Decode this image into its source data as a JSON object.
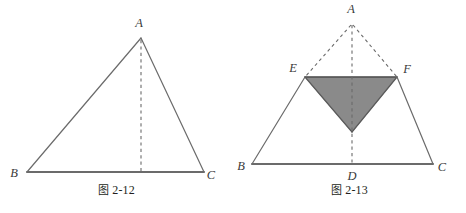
{
  "page": {
    "background_color": "#ffffff",
    "width": 466,
    "height": 213,
    "kind": "geometry-figure-pair"
  },
  "style": {
    "solid_stroke_color": "#6b6b6b",
    "dashed_stroke_color": "#6b6b6b",
    "baseline_stroke_color": "#6b6b6b",
    "shade_fill_color": "#8a8a8a",
    "shade_edge_color": "#4d4d4d",
    "label_color": "#3a3a3a",
    "solid_stroke_width": 1.2,
    "dashed_stroke_width": 1.1,
    "baseline_stroke_width": 2.0
  },
  "figure_1": {
    "caption_cjk": "图",
    "caption_number": "2-12",
    "caption_full": "图 2-12",
    "vertices": [
      {
        "name": "A",
        "label": "A",
        "x": 141,
        "y": 38,
        "label_x": 139,
        "label_y": 27
      },
      {
        "name": "B",
        "label": "B",
        "x": 27,
        "y": 172,
        "label_x": 14,
        "label_y": 177
      },
      {
        "name": "C",
        "label": "C",
        "x": 204,
        "y": 172,
        "label_x": 208,
        "label_y": 179
      },
      {
        "name": "D-foot",
        "label": "",
        "x": 141,
        "y": 172,
        "label_x": 141,
        "label_y": 172
      }
    ],
    "solid_edges": [
      {
        "name": "edge-AB",
        "from": "A",
        "to": "B"
      },
      {
        "name": "edge-AC",
        "from": "A",
        "to": "C"
      }
    ],
    "baseline_edges": [
      {
        "name": "edge-BC",
        "from": "B",
        "to": "C"
      }
    ],
    "dashed_edges": [
      {
        "name": "altitude-A-to-BC",
        "from": "A",
        "to": "D-foot"
      }
    ],
    "shaded_regions": []
  },
  "figure_2": {
    "caption_cjk": "图",
    "caption_number": "2-13",
    "caption_full": "图 2-13",
    "vertices": [
      {
        "name": "A",
        "label": "A",
        "x": 119,
        "y": 22,
        "label_x": 117,
        "label_y": 12
      },
      {
        "name": "B",
        "label": "B",
        "x": 19,
        "y": 164,
        "label_x": 7,
        "label_y": 170
      },
      {
        "name": "C",
        "label": "C",
        "x": 200,
        "y": 164,
        "label_x": 205,
        "label_y": 171
      },
      {
        "name": "D",
        "label": "D",
        "x": 119,
        "y": 164,
        "label_x": 116,
        "label_y": 180
      },
      {
        "name": "E",
        "label": "E",
        "x": 72,
        "y": 77,
        "label_x": 59,
        "label_y": 72
      },
      {
        "name": "F",
        "label": "F",
        "x": 164,
        "y": 77,
        "label_x": 169,
        "label_y": 73
      },
      {
        "name": "G-apex",
        "label": "",
        "x": 119,
        "y": 132,
        "label_x": 119,
        "label_y": 132
      }
    ],
    "solid_edges": [
      {
        "name": "edge-BE",
        "from": "B",
        "to": "E"
      },
      {
        "name": "edge-EG",
        "from": "E",
        "to": "G-apex"
      },
      {
        "name": "edge-GF",
        "from": "G-apex",
        "to": "F"
      },
      {
        "name": "edge-FC",
        "from": "F",
        "to": "C"
      }
    ],
    "baseline_edges": [
      {
        "name": "edge-BC",
        "from": "B",
        "to": "C"
      }
    ],
    "dashed_edges": [
      {
        "name": "edge-AE",
        "from": "A",
        "to": "E"
      },
      {
        "name": "edge-AF",
        "from": "A",
        "to": "F"
      },
      {
        "name": "altitude-AD",
        "from": "A",
        "to": "D"
      }
    ],
    "shaded_regions": [
      {
        "name": "shaded-triangle-EFG",
        "points": "E,F,G-apex",
        "fill": "#8a8a8a",
        "description": "folded-down triangle EFG with apex pointing toward D"
      }
    ]
  }
}
